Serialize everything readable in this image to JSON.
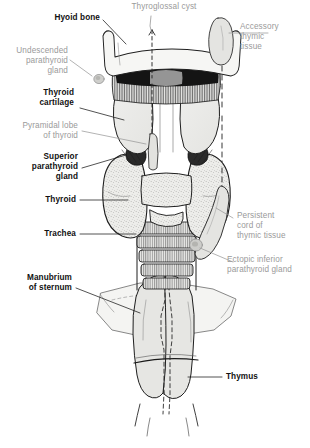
{
  "figure": {
    "ink_color": "#1a1a1a",
    "bold_label_color": "#111111",
    "grey_label_color": "#9a9a9a",
    "organ_fill": "#e8e8e6",
    "background": "#ffffff"
  },
  "labels": {
    "thyroglossal_cyst": "Thyroglossal cyst",
    "hyoid_bone": "Hyoid bone",
    "accessory_thymic_tissue": "Accessory\nthymic\ntissue",
    "undescended_parathyroid_gland": "Undescended\nparathyroid\ngland",
    "thyroid_cartilage": "Thyroid\ncartilage",
    "pyramidal_lobe_of_thyroid": "Pyramidal lobe\nof thyroid",
    "superior_parathyroid_gland": "Superior\nparathyroid\ngland",
    "thyroid": "Thyroid",
    "trachea": "Trachea",
    "persistent_cord_of_thymic_tissue": "Persistent\ncord of\nthymic tissue",
    "manubrium_of_sternum": "Manubrium\nof sternum",
    "ectopic_inferior_parathyroid_gland": "Ectopic inferior\nparathyroid gland",
    "thymus": "Thymus"
  },
  "label_styles": {
    "thyroglossal_cyst": "grey",
    "hyoid_bone": "bold",
    "accessory_thymic_tissue": "grey",
    "undescended_parathyroid_gland": "grey",
    "thyroid_cartilage": "bold",
    "pyramidal_lobe_of_thyroid": "grey",
    "superior_parathyroid_gland": "bold",
    "thyroid": "bold",
    "trachea": "bold",
    "persistent_cord_of_thymic_tissue": "grey",
    "manubrium_of_sternum": "bold",
    "ectopic_inferior_parathyroid_gland": "grey",
    "thymus": "bold"
  },
  "structures": [
    {
      "name": "hyoid-bone",
      "kind": "bone"
    },
    {
      "name": "thyrohyoid-membrane",
      "kind": "membrane"
    },
    {
      "name": "thyroid-cartilage",
      "kind": "cartilage"
    },
    {
      "name": "superior-parathyroid-gland",
      "kind": "gland"
    },
    {
      "name": "thyroid-gland",
      "kind": "gland"
    },
    {
      "name": "trachea",
      "kind": "airway"
    },
    {
      "name": "manubrium-of-sternum",
      "kind": "bone"
    },
    {
      "name": "thymus",
      "kind": "gland"
    },
    {
      "name": "accessory-thymic-tissue",
      "kind": "ectopic"
    },
    {
      "name": "persistent-cord-of-thymic-tissue",
      "kind": "ectopic"
    },
    {
      "name": "ectopic-inferior-parathyroid-gland",
      "kind": "ectopic"
    },
    {
      "name": "undescended-parathyroid-gland",
      "kind": "ectopic"
    },
    {
      "name": "thyroglossal-duct-tract",
      "kind": "tract"
    }
  ]
}
